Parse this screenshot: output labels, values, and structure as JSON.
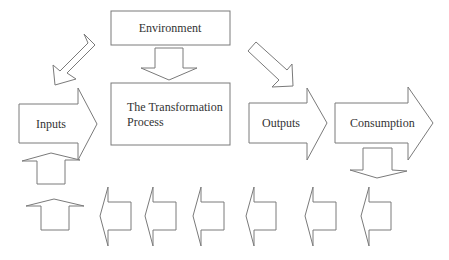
{
  "diagram": {
    "colors": {
      "stroke": "#7a7a7a",
      "fill": "#ffffff",
      "text": "#333333"
    },
    "boxes": {
      "environment": {
        "label": "Environment"
      },
      "transformation": {
        "line1": "The Transformation",
        "line2": "Process"
      }
    },
    "arrows": {
      "inputs": {
        "label": "Inputs",
        "direction": "right"
      },
      "outputs": {
        "label": "Outputs",
        "direction": "right"
      },
      "consumption": {
        "label": "Consumption",
        "direction": "right"
      },
      "env_to_process": {
        "direction": "down"
      },
      "env_to_inputs": {
        "direction": "down-left"
      },
      "env_to_outputs": {
        "direction": "down-right"
      },
      "consumption_down": {
        "direction": "down"
      },
      "feedback_up": [
        {
          "direction": "up"
        },
        {
          "direction": "up"
        }
      ],
      "feedback_left": [
        {
          "direction": "left"
        },
        {
          "direction": "left"
        },
        {
          "direction": "left"
        },
        {
          "direction": "left"
        },
        {
          "direction": "left"
        },
        {
          "direction": "left"
        }
      ]
    }
  }
}
